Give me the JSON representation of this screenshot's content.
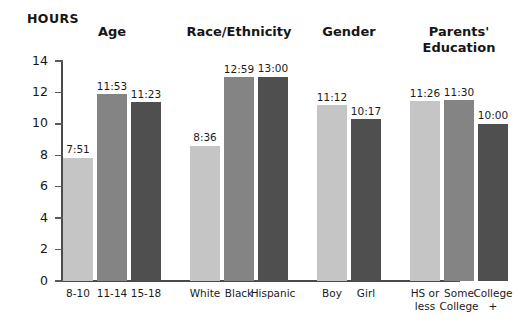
{
  "chart_data": {
    "type": "bar",
    "title": "",
    "subtitle": "",
    "xlabel": "",
    "ylabel": "HOURS",
    "ylim": [
      0,
      14
    ],
    "ytick_step": 2,
    "ytick_labels": [
      "14",
      "12",
      "10",
      "8",
      "6",
      "4",
      "2",
      "0"
    ],
    "grid": false,
    "legend": "none",
    "value_format": "hours:minutes",
    "colors": {
      "light": "#c5c5c5",
      "medium": "#848484",
      "dark": "#4f4f4f",
      "axis": "#4a4a4a",
      "text": "#1b1b1b"
    },
    "groups": [
      {
        "heading": "Age",
        "categories": [
          "8-10",
          "11-14",
          "15-18"
        ],
        "labels": [
          "7:51",
          "11:53",
          "11:23"
        ],
        "values": [
          7.85,
          11.88,
          11.38
        ],
        "shades": [
          "light",
          "medium",
          "dark"
        ]
      },
      {
        "heading": "Race/Ethnicity",
        "categories": [
          "White",
          "Black",
          "Hispanic"
        ],
        "labels": [
          "8:36",
          "12:59",
          "13:00"
        ],
        "values": [
          8.6,
          12.98,
          13.0
        ],
        "shades": [
          "light",
          "medium",
          "dark"
        ]
      },
      {
        "heading": "Gender",
        "categories": [
          "Boy",
          "Girl"
        ],
        "labels": [
          "11:12",
          "10:17"
        ],
        "values": [
          11.2,
          10.28
        ],
        "shades": [
          "light",
          "dark"
        ]
      },
      {
        "heading": "Parents'\nEducation",
        "categories": [
          "HS or\nless",
          "Some\nCollege",
          "College\n+"
        ],
        "labels": [
          "11:26",
          "11:30",
          "10:00"
        ],
        "values": [
          11.43,
          11.5,
          10.0
        ],
        "shades": [
          "light",
          "medium",
          "dark"
        ]
      }
    ]
  }
}
